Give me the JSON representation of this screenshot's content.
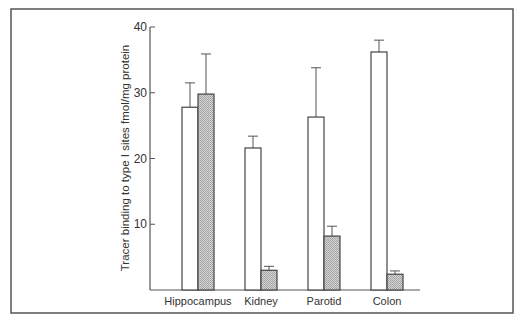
{
  "chart_data": {
    "type": "bar",
    "title": "",
    "xlabel": "",
    "ylabel": "Tracer binding to type I sites fmol/mg protein",
    "ylim": [
      0,
      40
    ],
    "yticks": [
      10,
      20,
      30,
      40
    ],
    "grid": false,
    "legend": null,
    "categories": [
      "Hippocampus",
      "Kidney",
      "Parotid",
      "Colon"
    ],
    "series": [
      {
        "name": "open bars",
        "fill": "#ffffff",
        "values": [
          27.8,
          21.6,
          26.3,
          36.2
        ],
        "error_upper": [
          31.5,
          23.4,
          33.8,
          38.0
        ]
      },
      {
        "name": "hatched bars",
        "fill": "#bdbdbd",
        "values": [
          29.8,
          3.0,
          8.2,
          2.4
        ],
        "error_upper": [
          35.9,
          3.6,
          9.7,
          2.9
        ]
      }
    ]
  },
  "colors": {
    "frame": "#555555",
    "axis": "#555555",
    "bar_stroke": "#444444",
    "hatch": "#bdbdbd"
  }
}
